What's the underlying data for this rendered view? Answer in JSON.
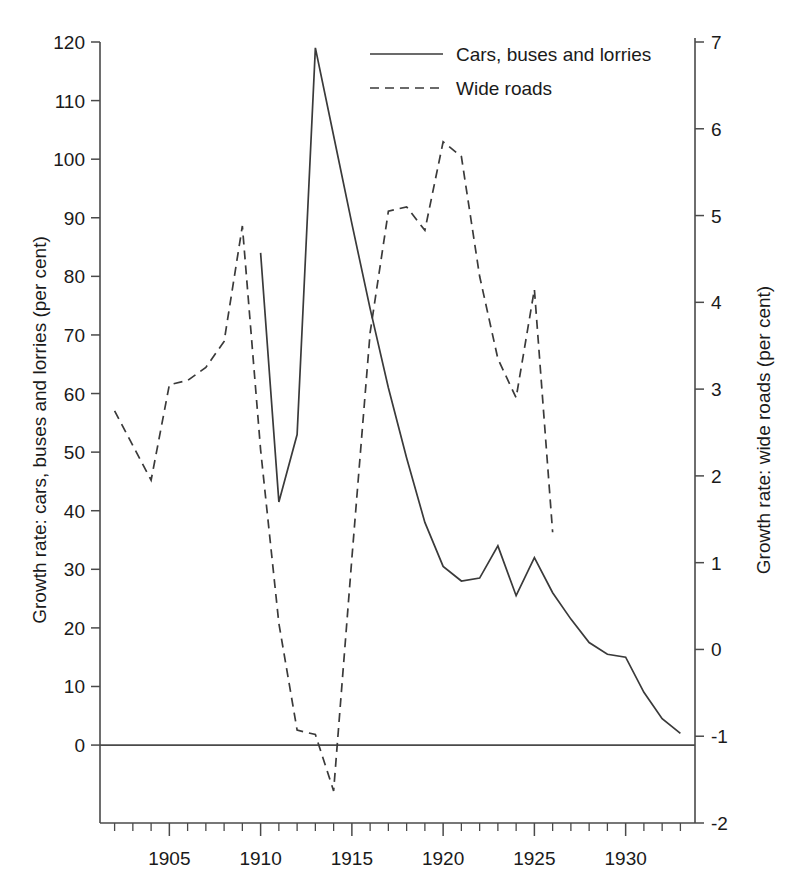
{
  "chart_data": {
    "type": "line",
    "title": "",
    "xlabel": "",
    "ylabel": "Growth rate: cars, buses and lorries (per cent)",
    "y2label": "Growth rate: wide roads (per cent)",
    "xlim": [
      1901.2,
      1933.8
    ],
    "ylim": [
      -13.3,
      120.0
    ],
    "y2lim": [
      -2,
      7
    ],
    "grid": false,
    "legend_position": "top-center",
    "x_tick_labels": [
      "1905",
      "1910",
      "1915",
      "1920",
      "1925",
      "1930"
    ],
    "x_tick_values": [
      1905,
      1910,
      1915,
      1920,
      1925,
      1930
    ],
    "x_minor_tick_step": 1,
    "y_tick_labels": [
      "0",
      "10",
      "20",
      "30",
      "40",
      "50",
      "60",
      "70",
      "80",
      "90",
      "100",
      "110",
      "120"
    ],
    "y_tick_values": [
      0,
      10,
      20,
      30,
      40,
      50,
      60,
      70,
      80,
      90,
      100,
      110,
      120
    ],
    "y2_tick_labels": [
      "-2",
      "-1",
      "0",
      "1",
      "2",
      "3",
      "4",
      "5",
      "6",
      "7"
    ],
    "y2_tick_values": [
      -2,
      -1,
      0,
      1,
      2,
      3,
      4,
      5,
      6,
      7
    ],
    "zero_line": 0,
    "series": [
      {
        "name": "Cars, buses and lorries",
        "axis": "left",
        "style": "solid",
        "x": [
          1910,
          1911,
          1912,
          1913,
          1914,
          1915,
          1916,
          1917,
          1918,
          1919,
          1920,
          1921,
          1922,
          1923,
          1924,
          1925,
          1926,
          1927,
          1928,
          1929,
          1930,
          1931,
          1932,
          1933
        ],
        "values": [
          84,
          41.5,
          53,
          119,
          104,
          89,
          74.5,
          61,
          49,
          38,
          30.5,
          28,
          28.5,
          34,
          25.5,
          32,
          26,
          21.5,
          17.5,
          15.5,
          15,
          9,
          4.5,
          2
        ]
      },
      {
        "name": "Wide roads",
        "axis": "right",
        "style": "dashed",
        "x": [
          1902,
          1903,
          1904,
          1905,
          1906,
          1907,
          1908,
          1909,
          1910,
          1911,
          1912,
          1913,
          1914,
          1915,
          1916,
          1917,
          1918,
          1919,
          1920,
          1921,
          1922,
          1923,
          1924,
          1925,
          1926
        ],
        "values": [
          2.75,
          2.35,
          1.95,
          3.05,
          3.1,
          3.25,
          3.55,
          4.88,
          2.3,
          0.3,
          -0.93,
          -0.98,
          -1.63,
          1.05,
          3.65,
          5.05,
          5.1,
          4.83,
          5.85,
          5.68,
          4.3,
          3.35,
          2.9,
          4.15,
          1.35
        ]
      }
    ],
    "legend": [
      {
        "label": "Cars, buses and lorries",
        "style": "solid"
      },
      {
        "label": "Wide roads",
        "style": "dashed"
      }
    ],
    "colors": {
      "line": "#3a3a3a",
      "axis": "#4a4a4a",
      "background": "#ffffff",
      "text": "#1a1a1a"
    }
  }
}
